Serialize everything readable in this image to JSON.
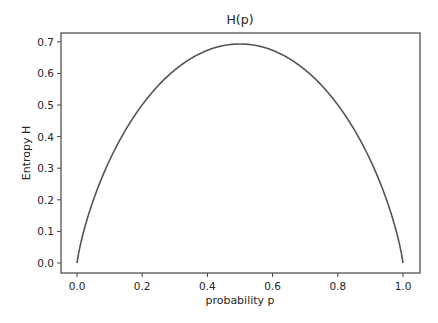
{
  "chart_data": {
    "type": "line",
    "title": "H(p)",
    "xlabel": "probability p",
    "ylabel": "Entropy H",
    "xlim": [
      -0.05,
      1.05
    ],
    "ylim": [
      -0.035,
      0.728
    ],
    "x_ticks": [
      "0.0",
      "0.2",
      "0.4",
      "0.6",
      "0.8",
      "1.0"
    ],
    "y_ticks": [
      "0.0",
      "0.1",
      "0.2",
      "0.3",
      "0.4",
      "0.5",
      "0.6",
      "0.7"
    ],
    "grid": false,
    "legend": null,
    "series": [
      {
        "name": "H(p) = -p ln p - (1-p) ln(1-p)",
        "color": "#555555",
        "x": [
          0.0,
          0.05,
          0.1,
          0.2,
          0.3,
          0.4,
          0.5,
          0.6,
          0.7,
          0.8,
          0.9,
          0.95,
          1.0
        ],
        "y": [
          0.0,
          0.199,
          0.325,
          0.5,
          0.611,
          0.673,
          0.693,
          0.673,
          0.611,
          0.5,
          0.325,
          0.199,
          0.0
        ]
      }
    ]
  }
}
